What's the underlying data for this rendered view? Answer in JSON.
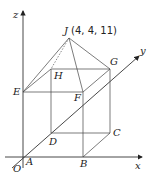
{
  "diagram": {
    "apex_label": "J (4, 4, 11)",
    "axes": {
      "x": "x",
      "y": "y",
      "z": "z",
      "origin": "O"
    },
    "points": {
      "A": "A",
      "B": "B",
      "C": "C",
      "D": "D",
      "E": "E",
      "F": "F",
      "G": "G",
      "H": "H",
      "J": "J"
    },
    "colors": {
      "line": "#444444",
      "background": "#ffffff"
    }
  }
}
